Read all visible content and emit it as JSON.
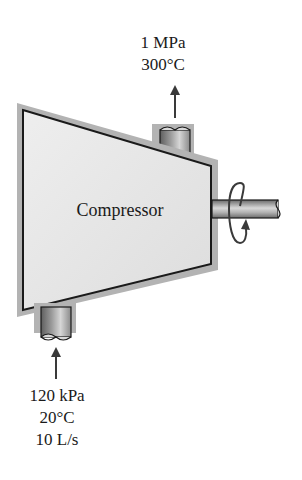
{
  "device": {
    "name": "Compressor"
  },
  "outlet": {
    "pressure": "1 MPa",
    "temperature": "300°C"
  },
  "inlet": {
    "pressure": "120 kPa",
    "temperature": "20°C",
    "flow_rate": "10 L/s"
  },
  "colors": {
    "body_fill": "#e6e6e6",
    "shadow": "#b3b3b3",
    "outline": "#1a1a1a",
    "pipe_dark": "#6e6e6e",
    "pipe_light": "#d0d0d0"
  },
  "icons": {
    "outlet_flow": "arrow-up-icon",
    "inlet_flow": "arrow-up-icon",
    "shaft_rotation": "rotation-arrow-icon"
  }
}
